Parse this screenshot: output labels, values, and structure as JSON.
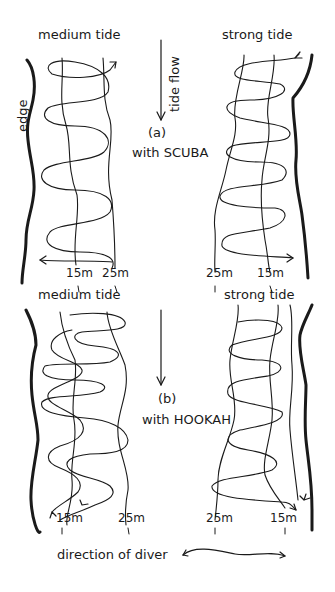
{
  "panel_a": {
    "tag": "(a)",
    "caption": "with SCUBA",
    "left": {
      "title": "medium tide",
      "depth_labels": [
        "15m",
        "25m"
      ]
    },
    "right": {
      "title": "strong tide",
      "depth_labels": [
        "25m",
        "15m"
      ]
    }
  },
  "panel_b": {
    "tag": "(b)",
    "caption": "with HOOKAH",
    "left": {
      "title": "medium tide",
      "depth_labels": [
        "15m",
        "25m"
      ]
    },
    "right": {
      "title": "strong tide",
      "depth_labels": [
        "25m",
        "15m"
      ]
    }
  },
  "labels": {
    "edge": "edge",
    "tide_flow": "tide flow",
    "direction_of_diver": "direction of diver"
  },
  "colors": {
    "ink": "#1a1a1a",
    "background": "#ffffff"
  }
}
